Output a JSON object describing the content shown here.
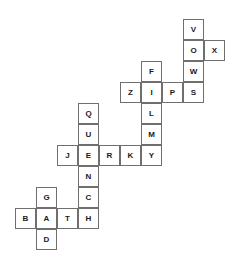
{
  "puzzle": {
    "type": "crossword-grid",
    "cell_size": 21,
    "origin_x": 15,
    "origin_y": 19,
    "words": [
      "VOWS",
      "OX",
      "FILMY",
      "ZIPS",
      "QUENCH",
      "JERKY",
      "GAD",
      "BATH"
    ],
    "cells": [
      {
        "letter": "V",
        "col": 8,
        "row": 0
      },
      {
        "letter": "O",
        "col": 8,
        "row": 1
      },
      {
        "letter": "X",
        "col": 9,
        "row": 1
      },
      {
        "letter": "W",
        "col": 8,
        "row": 2
      },
      {
        "letter": "F",
        "col": 6,
        "row": 2
      },
      {
        "letter": "Z",
        "col": 5,
        "row": 3
      },
      {
        "letter": "I",
        "col": 6,
        "row": 3
      },
      {
        "letter": "P",
        "col": 7,
        "row": 3
      },
      {
        "letter": "S",
        "col": 8,
        "row": 3
      },
      {
        "letter": "Q",
        "col": 3,
        "row": 4
      },
      {
        "letter": "L",
        "col": 6,
        "row": 4
      },
      {
        "letter": "U",
        "col": 3,
        "row": 5
      },
      {
        "letter": "M",
        "col": 6,
        "row": 5
      },
      {
        "letter": "J",
        "col": 2,
        "row": 6
      },
      {
        "letter": "E",
        "col": 3,
        "row": 6
      },
      {
        "letter": "R",
        "col": 4,
        "row": 6
      },
      {
        "letter": "K",
        "col": 5,
        "row": 6
      },
      {
        "letter": "Y",
        "col": 6,
        "row": 6
      },
      {
        "letter": "N",
        "col": 3,
        "row": 7
      },
      {
        "letter": "G",
        "col": 1,
        "row": 8
      },
      {
        "letter": "C",
        "col": 3,
        "row": 8
      },
      {
        "letter": "B",
        "col": 0,
        "row": 9
      },
      {
        "letter": "A",
        "col": 1,
        "row": 9
      },
      {
        "letter": "T",
        "col": 2,
        "row": 9
      },
      {
        "letter": "H",
        "col": 3,
        "row": 9
      },
      {
        "letter": "D",
        "col": 1,
        "row": 10
      }
    ]
  }
}
